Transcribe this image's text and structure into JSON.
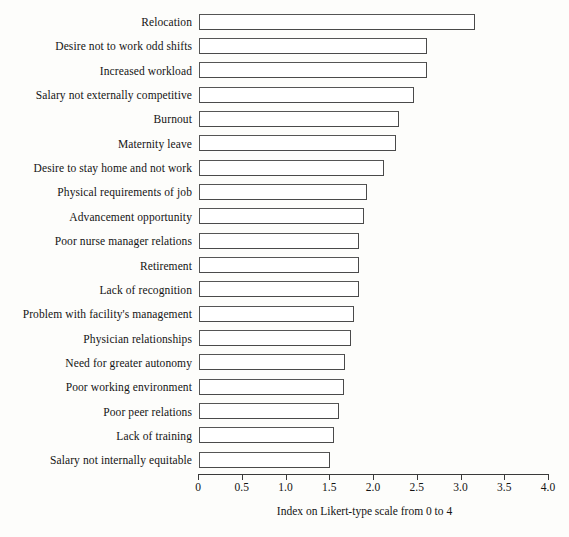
{
  "chart_data": {
    "type": "bar",
    "orientation": "horizontal",
    "title": "",
    "xlabel": "Index on Likert-type scale from 0 to 4",
    "ylabel": "",
    "xlim": [
      0,
      4.0
    ],
    "grid": false,
    "legend": null,
    "tick_labels": [
      "0",
      "0.5",
      "1.0",
      "1.5",
      "2.0",
      "2.5",
      "3.0",
      "3.5",
      "4.0"
    ],
    "tick_values": [
      0,
      0.5,
      1.0,
      1.5,
      2.0,
      2.5,
      3.0,
      3.5,
      4.0
    ],
    "bar_style": {
      "fill": "#ffffff",
      "edge": "#4a4a4a"
    },
    "categories": [
      "Relocation",
      "Desire not to work odd shifts",
      "Increased workload",
      "Salary not externally competitive",
      "Burnout",
      "Maternity leave",
      "Desire to stay home and not work",
      "Physical requirements of job",
      "Advancement opportunity",
      "Poor nurse manager relations",
      "Retirement",
      "Lack of recognition",
      "Problem with facility's management",
      "Physician relationships",
      "Need for greater autonomy",
      "Poor working environment",
      "Poor peer relations",
      "Lack of training",
      "Salary not internally equitable"
    ],
    "values": [
      3.15,
      2.6,
      2.6,
      2.46,
      2.29,
      2.25,
      2.11,
      1.92,
      1.88,
      1.83,
      1.83,
      1.83,
      1.77,
      1.74,
      1.67,
      1.66,
      1.6,
      1.54,
      1.5
    ]
  }
}
